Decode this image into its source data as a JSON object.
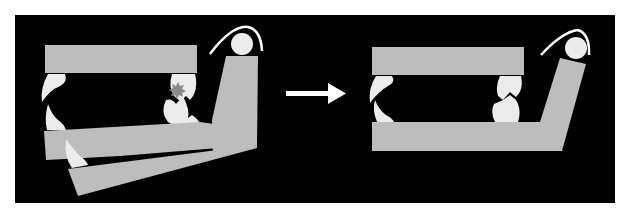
{
  "figure": {
    "background": "#000000",
    "page_background": "#ffffff",
    "bar_color": "#bdbdbd",
    "tooth_color": "#ececec",
    "contact_mark_color": "#8a8a8a",
    "arrow_color": "#ffffff"
  },
  "left_state": {
    "name": "misaligned-jaw-model",
    "has_contact_mark": true
  },
  "right_state": {
    "name": "aligned-jaw-model",
    "has_contact_mark": false
  },
  "arrow": {
    "direction": "right"
  }
}
